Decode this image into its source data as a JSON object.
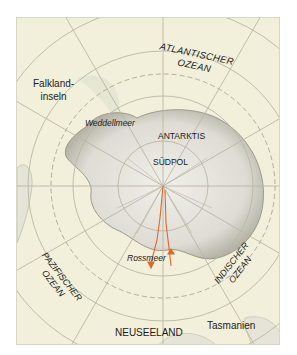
{
  "map": {
    "projection": "south-polar azimuthal",
    "colors": {
      "ocean": "#f2f0da",
      "land": "#e4e3dc",
      "graticule": "#b9b7a4",
      "route": "#e0662a",
      "label": "#1a1a1a"
    },
    "labels": {
      "atlantic_line1": "ATLANTISCHER",
      "atlantic_line2": "OZEAN",
      "falkland_line1": "Falkland-",
      "falkland_line2": "inseln",
      "weddell": "Weddellmeer",
      "antarctica": "ANTARKTIS",
      "south_pole": "SÜDPOL",
      "south_america": "SÜDAMERIKA",
      "ross": "Rossmeer",
      "pacific_line1": "PAZIFISCHER",
      "pacific_line2": "OZEAN",
      "indian_line1": "INDISCHER",
      "indian_line2": "OZEAN",
      "new_zealand": "NEUSEELAND",
      "tasmania": "Tasmanien"
    }
  }
}
